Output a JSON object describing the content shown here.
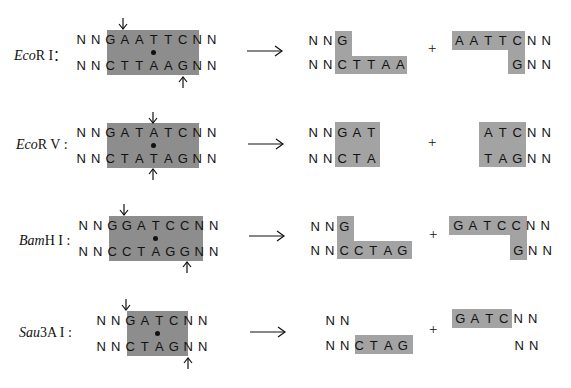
{
  "diagram": {
    "rows": [
      {
        "enzyme_label": "EcoRI：",
        "enzyme_italic": "Eco",
        "enzyme_rest": "R I：",
        "site_top": [
          "N",
          "N",
          "G",
          "A",
          "A",
          "T",
          "T",
          "C",
          "N",
          "N"
        ],
        "site_bottom": [
          "N",
          "N",
          "C",
          "T",
          "T",
          "A",
          "A",
          "G",
          "N",
          "N"
        ],
        "end_type": "sticky (5' overhang)",
        "product_left_top": [
          "N",
          "N",
          "G"
        ],
        "product_left_bottom": [
          "N",
          "N",
          "C",
          "T",
          "T",
          "A",
          "A"
        ],
        "plus": "+",
        "product_right_top": [
          "A",
          "A",
          "T",
          "T",
          "C",
          "N",
          "N"
        ],
        "product_right_bottom": [
          "G",
          "N",
          "N"
        ]
      },
      {
        "enzyme_label": "EcoRV：",
        "enzyme_italic": "Eco",
        "enzyme_rest": "R V :",
        "site_top": [
          "N",
          "N",
          "G",
          "A",
          "T",
          "A",
          "T",
          "C",
          "N",
          "N"
        ],
        "site_bottom": [
          "N",
          "N",
          "C",
          "T",
          "A",
          "T",
          "A",
          "G",
          "N",
          "N"
        ],
        "end_type": "blunt",
        "product_left_top": [
          "N",
          "N",
          "G",
          "A",
          "T"
        ],
        "product_left_bottom": [
          "N",
          "N",
          "C",
          "T",
          "A"
        ],
        "plus": "+",
        "product_right_top": [
          "A",
          "T",
          "C",
          "N",
          "N"
        ],
        "product_right_bottom": [
          "T",
          "A",
          "G",
          "N",
          "N"
        ]
      },
      {
        "enzyme_label": "BamHI：",
        "enzyme_italic": "Bam",
        "enzyme_rest": "H I :",
        "site_top": [
          "N",
          "N",
          "G",
          "G",
          "A",
          "T",
          "C",
          "C",
          "N",
          "N"
        ],
        "site_bottom": [
          "N",
          "N",
          "C",
          "C",
          "T",
          "A",
          "G",
          "G",
          "N",
          "N"
        ],
        "end_type": "sticky (5' overhang)",
        "product_left_top": [
          "N",
          "N",
          "G"
        ],
        "product_left_bottom": [
          "N",
          "N",
          "C",
          "C",
          "T",
          "A",
          "G"
        ],
        "plus": "+",
        "product_right_top": [
          "G",
          "A",
          "T",
          "C",
          "C",
          "N",
          "N"
        ],
        "product_right_bottom": [
          "G",
          "N",
          "N"
        ]
      },
      {
        "enzyme_label": "Sau3AI：",
        "enzyme_italic": "Sau",
        "enzyme_rest": "3A I :",
        "site_top": [
          "N",
          "N",
          "G",
          "A",
          "T",
          "C",
          "N",
          "N"
        ],
        "site_bottom": [
          "N",
          "N",
          "C",
          "T",
          "A",
          "G",
          "N",
          "N"
        ],
        "end_type": "sticky (5' overhang)",
        "product_left_top": [
          "N",
          "N"
        ],
        "product_left_bottom": [
          "N",
          "N",
          "C",
          "T",
          "A",
          "G"
        ],
        "plus": "+",
        "product_right_top": [
          "G",
          "A",
          "T",
          "C",
          "N",
          "N"
        ],
        "product_right_bottom": [
          "N",
          "N"
        ]
      }
    ],
    "colors": {
      "shade": "#8d8d8d",
      "shade_light": "#a3a3a3",
      "text": "#111111",
      "background": "#ffffff"
    },
    "icons": {
      "cut_arrow": "down/up arrow marking cleavage site",
      "reaction_arrow": "long right arrow",
      "center_dot": "filled dot marking symmetry center"
    }
  }
}
